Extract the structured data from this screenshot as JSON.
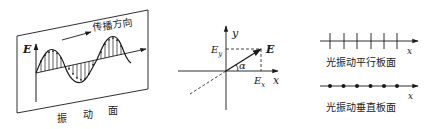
{
  "figure_1": {
    "title": "transverse light wave in vibration plane",
    "e_axis_label": "E",
    "propagation_label": "传播方向",
    "plane_label_chars": [
      "振",
      "动",
      "面"
    ]
  },
  "figure_2": {
    "y_axis_label": "y",
    "x_axis_label": "x",
    "vector_label": "E",
    "ey_label": "E",
    "ey_sub": "y",
    "ex_label": "E",
    "ex_sub": "x",
    "angle_label": "α"
  },
  "figure_3": {
    "top": {
      "axis_label": "x",
      "caption": "光振动平行板面",
      "tick_count": 6
    },
    "bottom": {
      "axis_label": "x",
      "caption": "光振动垂直板面",
      "dot_count": 6
    }
  },
  "colors": {
    "stroke": "#1a1a1a",
    "background": "#ffffff"
  }
}
